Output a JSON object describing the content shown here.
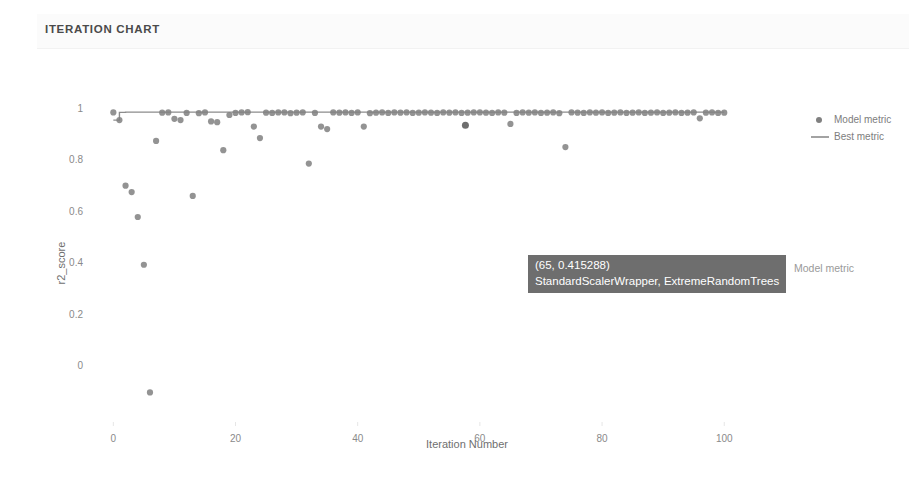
{
  "card": {
    "title": "ITERATION CHART"
  },
  "legend": {
    "position": "right",
    "items": [
      {
        "label": "Model metric",
        "marker": "dot",
        "color": "#808080"
      },
      {
        "label": "Best metric",
        "marker": "line",
        "color": "#808080"
      }
    ]
  },
  "tooltip": {
    "line1": "(65, 0.415288)",
    "line2": "StandardScalerWrapper, ExtremeRandomTrees",
    "side_label": "Model metric",
    "background": "#6e6e6e"
  },
  "chart_data": {
    "type": "scatter",
    "title": "ITERATION CHART",
    "xlabel": "Iteration Number",
    "ylabel": "r2_score",
    "xlim": [
      -3,
      107
    ],
    "ylim": [
      -0.22,
      1.08
    ],
    "xticks": [
      0,
      20,
      40,
      60,
      80,
      100
    ],
    "yticks": [
      0,
      0.2,
      0.4,
      0.6,
      0.8,
      1
    ],
    "grid": false,
    "legend_position": "right",
    "marker_color": "#808080",
    "line_color": "#8c8c8c",
    "series": [
      {
        "name": "Model metric",
        "type": "scatter",
        "x": [
          0,
          1,
          2,
          3,
          4,
          5,
          6,
          7,
          8,
          9,
          10,
          11,
          12,
          13,
          14,
          15,
          16,
          17,
          18,
          19,
          20,
          21,
          22,
          23,
          24,
          25,
          26,
          27,
          28,
          29,
          30,
          31,
          32,
          33,
          34,
          35,
          36,
          37,
          38,
          39,
          40,
          41,
          42,
          43,
          44,
          45,
          46,
          47,
          48,
          49,
          50,
          51,
          52,
          53,
          54,
          55,
          56,
          57,
          58,
          59,
          60,
          61,
          62,
          63,
          64,
          65,
          66,
          67,
          68,
          69,
          70,
          71,
          72,
          73,
          74,
          75,
          76,
          77,
          78,
          79,
          80,
          81,
          82,
          83,
          84,
          85,
          86,
          87,
          88,
          89,
          90,
          91,
          92,
          93,
          94,
          95,
          96,
          97,
          98,
          99,
          100
        ],
        "y": [
          0.985,
          0.955,
          0.7,
          0.675,
          0.578,
          0.392,
          -0.105,
          0.874,
          0.984,
          0.985,
          0.96,
          0.955,
          0.983,
          0.66,
          0.982,
          0.985,
          0.95,
          0.947,
          0.838,
          0.975,
          0.983,
          0.985,
          0.986,
          0.93,
          0.885,
          0.984,
          0.983,
          0.985,
          0.985,
          0.982,
          0.984,
          0.985,
          0.786,
          0.983,
          0.93,
          0.92,
          0.985,
          0.984,
          0.985,
          0.983,
          0.985,
          0.93,
          0.982,
          0.984,
          0.985,
          0.983,
          0.985,
          0.984,
          0.985,
          0.983,
          0.984,
          0.985,
          0.984,
          0.983,
          0.985,
          0.984,
          0.985,
          0.983,
          0.984,
          0.985,
          0.985,
          0.984,
          0.983,
          0.985,
          0.984,
          0.94,
          0.983,
          0.985,
          0.984,
          0.985,
          0.983,
          0.984,
          0.985,
          0.982,
          0.85,
          0.985,
          0.984,
          0.983,
          0.985,
          0.984,
          0.985,
          0.983,
          0.984,
          0.985,
          0.983,
          0.984,
          0.985,
          0.983,
          0.984,
          0.985,
          0.983,
          0.984,
          0.985,
          0.983,
          0.984,
          0.985,
          0.962,
          0.984,
          0.985,
          0.983,
          0.984
        ]
      },
      {
        "name": "Best metric",
        "type": "line",
        "x": [
          0,
          1,
          2,
          100
        ],
        "y": [
          0.955,
          0.985,
          0.986,
          0.986
        ]
      }
    ],
    "highlight_point": {
      "x": 65,
      "y": 0.415288
    }
  }
}
